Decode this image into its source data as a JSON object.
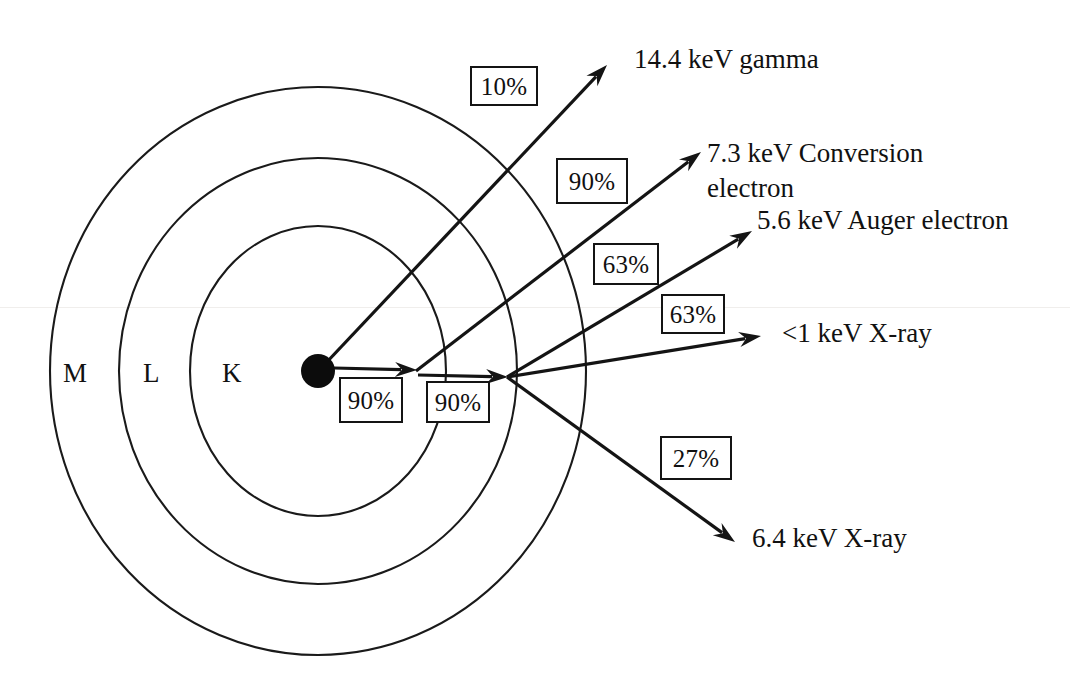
{
  "figure": {
    "kind": "atomic-shell-decay-diagram",
    "background_color": "#ffffff",
    "ink_color": "#141414"
  },
  "nucleus": {
    "name": "nucleus",
    "fill_color": "#0c0c0c",
    "cx": 318,
    "cy": 371,
    "r": 17
  },
  "shells": [
    {
      "id": "K",
      "label": "K",
      "label_x": 222,
      "label_y": 360,
      "rx": 128,
      "ry": 145
    },
    {
      "id": "L",
      "label": "L",
      "label_x": 143,
      "label_y": 360,
      "rx": 199,
      "ry": 213
    },
    {
      "id": "M",
      "label": "M",
      "label_x": 63,
      "label_y": 360,
      "rx": 268,
      "ry": 284
    }
  ],
  "percent_boxes": [
    {
      "id": "gamma-branch",
      "value": "10%",
      "x": 470,
      "y": 66,
      "w": 68,
      "h": 40
    },
    {
      "id": "conversion-branch",
      "value": "90%",
      "x": 556,
      "y": 158,
      "w": 72,
      "h": 46
    },
    {
      "id": "auger-branch",
      "value": "63%",
      "x": 593,
      "y": 243,
      "w": 66,
      "h": 42
    },
    {
      "id": "soft-xray-branch",
      "value": "63%",
      "x": 661,
      "y": 294,
      "w": 64,
      "h": 40
    },
    {
      "id": "hard-xray-branch",
      "value": "27%",
      "x": 660,
      "y": 436,
      "w": 72,
      "h": 44
    },
    {
      "id": "k-vacancy-branch",
      "value": "90%",
      "x": 339,
      "y": 377,
      "w": 64,
      "h": 46
    },
    {
      "id": "l-vacancy-branch",
      "value": "90%",
      "x": 426,
      "y": 381,
      "w": 64,
      "h": 42
    }
  ],
  "emissions": [
    {
      "id": "gamma",
      "label": "14.4 keV gamma",
      "label_x": 634,
      "label_y": 42,
      "origin": {
        "x": 325,
        "y": 364
      },
      "tip": {
        "x": 607,
        "y": 65
      }
    },
    {
      "id": "conversion-electron",
      "label": "7.3 keV Conversion\nelectron",
      "label_x": 707,
      "label_y": 136,
      "origin": {
        "x": 416,
        "y": 371
      },
      "tip": {
        "x": 701,
        "y": 152
      }
    },
    {
      "id": "auger-electron",
      "label": "5.6 keV Auger electron",
      "label_x": 757,
      "label_y": 203,
      "origin": {
        "x": 507,
        "y": 377
      },
      "tip": {
        "x": 752,
        "y": 231
      }
    },
    {
      "id": "soft-xray",
      "label": "<1 keV X-ray",
      "label_x": 782,
      "label_y": 316,
      "origin": {
        "x": 507,
        "y": 377
      },
      "tip": {
        "x": 761,
        "y": 336
      }
    },
    {
      "id": "hard-xray",
      "label": "6.4 keV X-ray",
      "label_x": 752,
      "label_y": 521,
      "origin": {
        "x": 507,
        "y": 377
      },
      "tip": {
        "x": 735,
        "y": 542
      }
    },
    {
      "id": "k-shell-vacancy-fill",
      "label": "",
      "origin": {
        "x": 334,
        "y": 368
      },
      "tip": {
        "x": 417,
        "y": 370
      }
    },
    {
      "id": "l-shell-vacancy-fill",
      "label": "",
      "origin": {
        "x": 418,
        "y": 375
      },
      "tip": {
        "x": 508,
        "y": 377
      }
    }
  ]
}
